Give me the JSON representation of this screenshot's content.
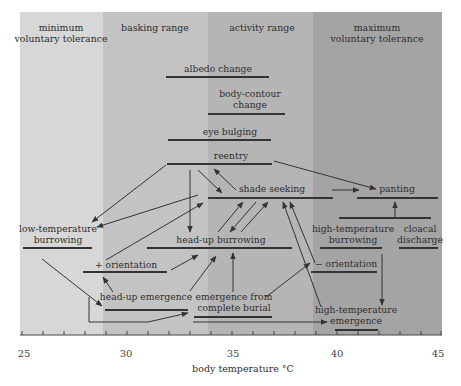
{
  "figure": {
    "xlabel": "body temperature °C",
    "x_ticks": [
      "25",
      "30",
      "35",
      "40",
      "45"
    ],
    "x_range": [
      25,
      45
    ],
    "zones": [
      {
        "id": "minimum",
        "label_lines": [
          "minimum",
          "voluntary tolerance"
        ],
        "from": 25,
        "to": 28.9,
        "color": "#d6d6d6"
      },
      {
        "id": "basking",
        "label_lines": [
          "basking range"
        ],
        "from": 28.9,
        "to": 33.9,
        "color": "#c2c2c2"
      },
      {
        "id": "activity",
        "label_lines": [
          "activity range"
        ],
        "from": 33.9,
        "to": 38.9,
        "color": "#b4b4b4"
      },
      {
        "id": "maximum",
        "label_lines": [
          "maximum",
          "voluntary tolerance"
        ],
        "from": 38.9,
        "to": 45,
        "color": "#a3a3a3"
      }
    ],
    "behaviors": [
      {
        "id": "albedo-change",
        "label_lines": [
          "albedo change"
        ],
        "from": 32.0,
        "to": 37.0
      },
      {
        "id": "body-contour-change",
        "label_lines": [
          "body-contour",
          "change"
        ],
        "from": 34.0,
        "to": 37.6
      },
      {
        "id": "eye-bulging",
        "label_lines": [
          "eye bulging"
        ],
        "from": 32.1,
        "to": 37.0
      },
      {
        "id": "reentry",
        "label_lines": [
          "reentry"
        ],
        "from": 32.1,
        "to": 37.0
      },
      {
        "id": "shade-seeking",
        "label_lines": [
          "shade seeking"
        ],
        "from": 33.9,
        "to": 39.7
      },
      {
        "id": "panting",
        "label_lines": [
          "panting"
        ],
        "from": 40.0,
        "to": 43.9
      },
      {
        "id": "low-temperature-burrowing",
        "label_lines": [
          "low-temperature",
          "burrowing"
        ],
        "from": 25.0,
        "to": 28.3
      },
      {
        "id": "head-up-burrowing",
        "label_lines": [
          "head-up burrowing"
        ],
        "from": 31.1,
        "to": 38.3
      },
      {
        "id": "high-temperature-burrowing",
        "label_lines": [
          "high-temperature",
          "burrowing"
        ],
        "from": 38.6,
        "to": 41.9
      },
      {
        "id": "cloacal-discharge",
        "label_lines": [
          "cloacal",
          "discharge"
        ],
        "from": 42.1,
        "to": 44.9
      },
      {
        "id": "plus-orientation",
        "label_lines": [
          "+ orientation"
        ],
        "from": 28.7,
        "to": 32.0
      },
      {
        "id": "minus-orientation",
        "label_lines": [
          "− orientation"
        ],
        "from": 38.4,
        "to": 41.4
      },
      {
        "id": "head-up-emergence",
        "label_lines": [
          "head-up emergence"
        ],
        "from": 28.9,
        "to": 33.1
      },
      {
        "id": "emergence-from-complete-burial",
        "label_lines": [
          "emergence from",
          "complete burial"
        ],
        "from": 33.7,
        "to": 36.8
      },
      {
        "id": "high-temperature-emergence",
        "label_lines": [
          "high-temperature",
          "emergence"
        ],
        "from": 39.1,
        "to": 41.4
      }
    ],
    "transitions": [
      [
        "reentry",
        "low-temperature-burrowing"
      ],
      [
        "shade-seeking",
        "low-temperature-burrowing"
      ],
      [
        "reentry",
        "head-up-burrowing"
      ],
      [
        "reentry",
        "shade-seeking"
      ],
      [
        "shade-seeking",
        "reentry"
      ],
      [
        "reentry",
        "panting"
      ],
      [
        "shade-seeking",
        "panting"
      ],
      [
        "high-temperature-burrowing",
        "panting"
      ],
      [
        "head-up-burrowing",
        "shade-seeking"
      ],
      [
        "shade-seeking",
        "head-up-burrowing"
      ],
      [
        "plus-orientation",
        "shade-seeking"
      ],
      [
        "low-temperature-burrowing",
        "head-up-emergence"
      ],
      [
        "head-up-emergence",
        "plus-orientation"
      ],
      [
        "plus-orientation",
        "head-up-burrowing"
      ],
      [
        "emergence-from-complete-burial",
        "head-up-burrowing"
      ],
      [
        "emergence-from-complete-burial",
        "shade-seeking"
      ],
      [
        "minus-orientation",
        "shade-seeking"
      ],
      [
        "high-temperature-emergence",
        "shade-seeking"
      ],
      [
        "high-temperature-burrowing",
        "high-temperature-emergence"
      ],
      [
        "low-temperature-burrowing",
        "emergence-from-complete-burial"
      ],
      [
        "low-temperature-burrowing",
        "high-temperature-emergence"
      ]
    ]
  }
}
